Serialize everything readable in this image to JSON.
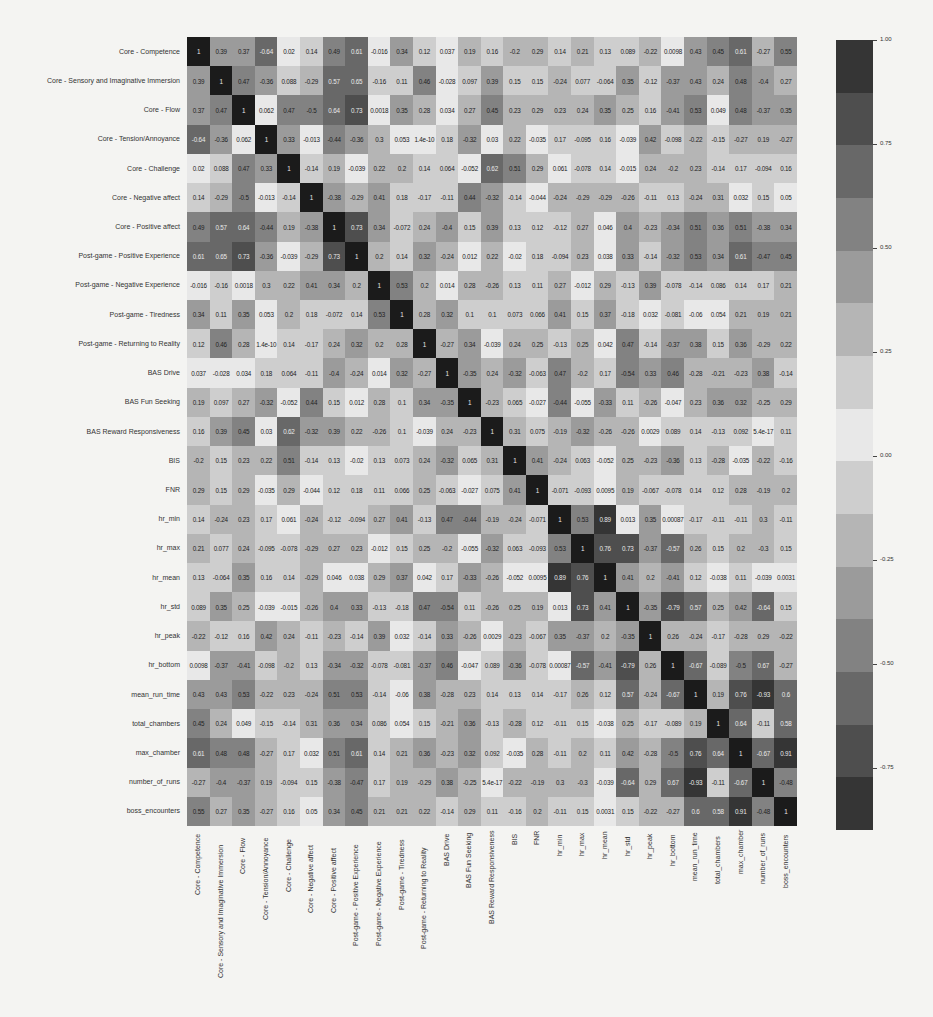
{
  "chart_data": {
    "type": "heatmap",
    "title": "",
    "xlabel": "",
    "ylabel": "",
    "colormap": "diverging grayscale (dark at ±1, light at 0)",
    "vmin": -0.9,
    "vmax": 1.0,
    "colorbar_ticks": [
      "1.00",
      "0.75",
      "0.50",
      "0.25",
      "0.00",
      "-0.25",
      "-0.50",
      "-0.75"
    ],
    "labels": [
      "Core - Competence",
      "Core - Sensory and Imaginative Immersion",
      "Core - Flow",
      "Core - Tension/Annoyance",
      "Core - Challenge",
      "Core - Negative affect",
      "Core - Positive affect",
      "Post-game - Positive Experience",
      "Post-game - Negative Experience",
      "Post-game - Tiredness",
      "Post-game - Returning to Reality",
      "BAS Drive",
      "BAS Fun Seeking",
      "BAS Reward Responsiveness",
      "BIS",
      "FNR",
      "hr_min",
      "hr_max",
      "hr_mean",
      "hr_std",
      "hr_peak",
      "hr_bottom",
      "mean_run_time",
      "total_chambers",
      "max_chamber",
      "number_of_runs",
      "boss_encounters"
    ],
    "matrix": [
      [
        "1",
        "0.39",
        "0.37",
        "-0.64",
        "0.02",
        "0.14",
        "0.49",
        "0.61",
        "-0.016",
        "0.34",
        "0.12",
        "0.037",
        "0.19",
        "0.16",
        "-0.2",
        "0.29",
        "0.14",
        "0.21",
        "0.13",
        "0.089",
        "-0.22",
        "0.0098",
        "0.43",
        "0.45",
        "0.61",
        "-0.27",
        "0.55"
      ],
      [
        "0.39",
        "1",
        "0.47",
        "-0.36",
        "0.088",
        "-0.29",
        "0.57",
        "0.65",
        "-0.16",
        "0.11",
        "0.46",
        "-0.028",
        "0.097",
        "0.39",
        "0.15",
        "0.15",
        "-0.24",
        "0.077",
        "-0.064",
        "0.35",
        "-0.12",
        "-0.37",
        "0.43",
        "0.24",
        "0.48",
        "-0.4",
        "0.27"
      ],
      [
        "0.37",
        "0.47",
        "1",
        "0.062",
        "0.47",
        "-0.5",
        "0.64",
        "0.73",
        "0.0018",
        "0.35",
        "0.28",
        "0.034",
        "0.27",
        "0.45",
        "0.23",
        "0.29",
        "0.23",
        "0.24",
        "0.35",
        "0.25",
        "0.16",
        "-0.41",
        "0.53",
        "0.049",
        "0.48",
        "-0.37",
        "0.35"
      ],
      [
        "-0.64",
        "-0.36",
        "0.062",
        "1",
        "0.33",
        "-0.013",
        "-0.44",
        "-0.36",
        "0.3",
        "0.053",
        "1.4e-10",
        "0.18",
        "-0.32",
        "0.03",
        "0.22",
        "-0.035",
        "0.17",
        "-0.095",
        "0.16",
        "-0.039",
        "0.42",
        "-0.098",
        "-0.22",
        "-0.15",
        "-0.27",
        "0.19",
        "-0.27"
      ],
      [
        "0.02",
        "0.088",
        "0.47",
        "0.33",
        "1",
        "-0.14",
        "0.19",
        "-0.039",
        "0.22",
        "0.2",
        "0.14",
        "0.064",
        "-0.052",
        "0.62",
        "0.51",
        "0.29",
        "0.061",
        "-0.078",
        "0.14",
        "-0.015",
        "0.24",
        "-0.2",
        "0.23",
        "-0.14",
        "0.17",
        "-0.094",
        "0.16"
      ],
      [
        "0.14",
        "-0.29",
        "-0.5",
        "-0.013",
        "-0.14",
        "1",
        "-0.38",
        "-0.29",
        "0.41",
        "0.18",
        "-0.17",
        "-0.11",
        "0.44",
        "-0.32",
        "-0.14",
        "-0.044",
        "-0.24",
        "-0.29",
        "-0.29",
        "-0.26",
        "-0.11",
        "0.13",
        "-0.24",
        "0.31",
        "0.032",
        "0.15",
        "0.05"
      ],
      [
        "0.49",
        "0.57",
        "0.64",
        "-0.44",
        "0.19",
        "-0.38",
        "1",
        "0.73",
        "0.34",
        "-0.072",
        "0.24",
        "-0.4",
        "0.15",
        "0.39",
        "0.13",
        "0.12",
        "-0.12",
        "0.27",
        "0.046",
        "0.4",
        "-0.23",
        "-0.34",
        "0.51",
        "0.36",
        "0.51",
        "-0.38",
        "0.34"
      ],
      [
        "0.61",
        "0.65",
        "0.73",
        "-0.36",
        "-0.039",
        "-0.29",
        "0.73",
        "1",
        "0.2",
        "0.14",
        "0.32",
        "-0.24",
        "0.012",
        "0.22",
        "-0.02",
        "0.18",
        "-0.094",
        "0.23",
        "0.038",
        "0.33",
        "-0.14",
        "-0.32",
        "0.53",
        "0.34",
        "0.61",
        "-0.47",
        "0.45"
      ],
      [
        "-0.016",
        "-0.16",
        "0.0018",
        "0.3",
        "0.22",
        "0.41",
        "0.34",
        "0.2",
        "1",
        "0.53",
        "0.2",
        "0.014",
        "0.28",
        "-0.26",
        "0.13",
        "0.11",
        "0.27",
        "-0.012",
        "0.29",
        "-0.13",
        "0.39",
        "-0.078",
        "-0.14",
        "0.086",
        "0.14",
        "0.17",
        "0.21"
      ],
      [
        "0.34",
        "0.11",
        "0.35",
        "0.053",
        "0.2",
        "0.18",
        "-0.072",
        "0.14",
        "0.53",
        "1",
        "0.28",
        "0.32",
        "0.1",
        "0.1",
        "0.073",
        "0.066",
        "0.41",
        "0.15",
        "0.37",
        "-0.18",
        "0.032",
        "-0.081",
        "-0.06",
        "0.054",
        "0.21",
        "0.19",
        "0.21"
      ],
      [
        "0.12",
        "0.46",
        "0.28",
        "1.4e-10",
        "0.14",
        "-0.17",
        "0.24",
        "0.32",
        "0.2",
        "0.28",
        "1",
        "-0.27",
        "0.34",
        "-0.039",
        "0.24",
        "0.25",
        "-0.13",
        "0.25",
        "0.042",
        "0.47",
        "-0.14",
        "-0.37",
        "0.38",
        "0.15",
        "0.36",
        "-0.29",
        "0.22"
      ],
      [
        "0.037",
        "-0.028",
        "0.034",
        "0.18",
        "0.064",
        "-0.11",
        "-0.4",
        "-0.24",
        "0.014",
        "0.32",
        "-0.27",
        "1",
        "-0.35",
        "0.24",
        "-0.32",
        "-0.063",
        "0.47",
        "-0.2",
        "0.17",
        "-0.54",
        "0.33",
        "0.46",
        "-0.28",
        "-0.21",
        "-0.23",
        "0.38",
        "-0.14"
      ],
      [
        "0.19",
        "0.097",
        "0.27",
        "-0.32",
        "-0.052",
        "0.44",
        "0.15",
        "0.012",
        "0.28",
        "0.1",
        "0.34",
        "-0.35",
        "1",
        "-0.23",
        "0.065",
        "-0.027",
        "-0.44",
        "-0.055",
        "-0.33",
        "0.11",
        "-0.26",
        "-0.047",
        "0.23",
        "0.36",
        "0.32",
        "-0.25",
        "0.29"
      ],
      [
        "0.16",
        "0.39",
        "0.45",
        "0.03",
        "0.62",
        "-0.32",
        "0.39",
        "0.22",
        "-0.26",
        "0.1",
        "-0.039",
        "0.24",
        "-0.23",
        "1",
        "0.31",
        "0.075",
        "-0.19",
        "-0.32",
        "-0.26",
        "-0.26",
        "0.0029",
        "0.089",
        "0.14",
        "-0.13",
        "0.092",
        "5.4e-17",
        "0.11"
      ],
      [
        "-0.2",
        "0.15",
        "0.23",
        "0.22",
        "0.51",
        "-0.14",
        "0.13",
        "-0.02",
        "0.13",
        "0.073",
        "0.24",
        "-0.32",
        "0.065",
        "0.31",
        "1",
        "0.41",
        "-0.24",
        "0.063",
        "-0.052",
        "0.25",
        "-0.23",
        "-0.36",
        "0.13",
        "-0.28",
        "-0.035",
        "-0.22",
        "-0.16"
      ],
      [
        "0.29",
        "0.15",
        "0.29",
        "-0.035",
        "0.29",
        "-0.044",
        "0.12",
        "0.18",
        "0.11",
        "0.066",
        "0.25",
        "-0.063",
        "-0.027",
        "0.075",
        "0.41",
        "1",
        "-0.071",
        "-0.093",
        "0.0095",
        "0.19",
        "-0.067",
        "-0.078",
        "0.14",
        "0.12",
        "0.28",
        "-0.19",
        "0.2"
      ],
      [
        "0.14",
        "-0.24",
        "0.23",
        "0.17",
        "0.061",
        "-0.24",
        "-0.12",
        "-0.094",
        "0.27",
        "0.41",
        "-0.13",
        "0.47",
        "-0.44",
        "-0.19",
        "-0.24",
        "-0.071",
        "1",
        "0.53",
        "0.89",
        "0.013",
        "0.35",
        "0.00087",
        "-0.17",
        "-0.11",
        "-0.11",
        "0.3",
        "-0.11"
      ],
      [
        "0.21",
        "0.077",
        "0.24",
        "-0.095",
        "-0.078",
        "-0.29",
        "0.27",
        "0.23",
        "-0.012",
        "0.15",
        "0.25",
        "-0.2",
        "-0.055",
        "-0.32",
        "0.063",
        "-0.093",
        "0.53",
        "1",
        "0.76",
        "0.73",
        "-0.37",
        "-0.57",
        "0.26",
        "0.15",
        "0.2",
        "-0.3",
        "0.15"
      ],
      [
        "0.13",
        "-0.064",
        "0.35",
        "0.16",
        "0.14",
        "-0.29",
        "0.046",
        "0.038",
        "0.29",
        "0.37",
        "0.042",
        "0.17",
        "-0.33",
        "-0.26",
        "-0.052",
        "0.0095",
        "0.89",
        "0.76",
        "1",
        "0.41",
        "0.2",
        "-0.41",
        "0.12",
        "-0.038",
        "0.11",
        "-0.039",
        "0.0031"
      ],
      [
        "0.089",
        "0.35",
        "0.25",
        "-0.039",
        "-0.015",
        "-0.26",
        "0.4",
        "0.33",
        "-0.13",
        "-0.18",
        "0.47",
        "-0.54",
        "0.11",
        "-0.26",
        "0.25",
        "0.19",
        "0.013",
        "0.73",
        "0.41",
        "1",
        "-0.35",
        "-0.79",
        "0.57",
        "0.25",
        "0.42",
        "-0.64",
        "0.15"
      ],
      [
        "-0.22",
        "-0.12",
        "0.16",
        "0.42",
        "0.24",
        "-0.11",
        "-0.23",
        "-0.14",
        "0.39",
        "0.032",
        "-0.14",
        "0.33",
        "-0.26",
        "0.0029",
        "-0.23",
        "-0.067",
        "0.35",
        "-0.37",
        "0.2",
        "-0.35",
        "1",
        "0.26",
        "-0.24",
        "-0.17",
        "-0.28",
        "0.29",
        "-0.22"
      ],
      [
        "0.0098",
        "-0.37",
        "-0.41",
        "-0.098",
        "-0.2",
        "0.13",
        "-0.34",
        "-0.32",
        "-0.078",
        "-0.081",
        "-0.37",
        "0.46",
        "-0.047",
        "0.089",
        "-0.36",
        "-0.078",
        "0.00087",
        "-0.57",
        "-0.41",
        "-0.79",
        "0.26",
        "1",
        "-0.67",
        "-0.089",
        "-0.5",
        "0.67",
        "-0.27"
      ],
      [
        "0.43",
        "0.43",
        "0.53",
        "-0.22",
        "0.23",
        "-0.24",
        "0.51",
        "0.53",
        "-0.14",
        "-0.06",
        "0.38",
        "-0.28",
        "0.23",
        "0.14",
        "0.13",
        "0.14",
        "-0.17",
        "0.26",
        "0.12",
        "0.57",
        "-0.24",
        "-0.67",
        "1",
        "0.19",
        "0.76",
        "-0.93",
        "0.6"
      ],
      [
        "0.45",
        "0.24",
        "0.049",
        "-0.15",
        "-0.14",
        "0.31",
        "0.36",
        "0.34",
        "0.086",
        "0.054",
        "0.15",
        "-0.21",
        "0.36",
        "-0.13",
        "-0.28",
        "0.12",
        "-0.11",
        "0.15",
        "-0.038",
        "0.25",
        "-0.17",
        "-0.089",
        "0.19",
        "1",
        "0.64",
        "-0.11",
        "0.58"
      ],
      [
        "0.61",
        "0.48",
        "0.48",
        "-0.27",
        "0.17",
        "0.032",
        "0.51",
        "0.61",
        "0.14",
        "0.21",
        "0.36",
        "-0.23",
        "0.32",
        "0.092",
        "-0.035",
        "0.28",
        "-0.11",
        "0.2",
        "0.11",
        "0.42",
        "-0.28",
        "-0.5",
        "0.76",
        "0.64",
        "1",
        "-0.67",
        "0.91"
      ],
      [
        "-0.27",
        "-0.4",
        "-0.37",
        "0.19",
        "-0.094",
        "0.15",
        "-0.38",
        "-0.47",
        "0.17",
        "0.19",
        "-0.29",
        "0.38",
        "-0.25",
        "5.4e-17",
        "-0.22",
        "-0.19",
        "0.3",
        "-0.3",
        "-0.039",
        "-0.64",
        "0.29",
        "0.67",
        "-0.93",
        "-0.11",
        "-0.67",
        "1",
        "-0.48"
      ],
      [
        "0.55",
        "0.27",
        "0.35",
        "-0.27",
        "0.16",
        "0.05",
        "0.34",
        "0.45",
        "0.21",
        "0.21",
        "0.22",
        "-0.14",
        "0.29",
        "0.11",
        "-0.16",
        "0.2",
        "-0.11",
        "0.15",
        "0.0031",
        "0.15",
        "-0.22",
        "-0.27",
        "0.6",
        "0.58",
        "0.91",
        "-0.48",
        "1"
      ]
    ]
  }
}
